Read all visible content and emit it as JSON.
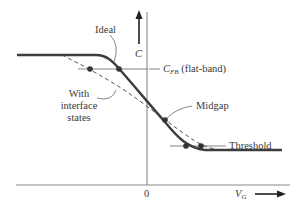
{
  "diagram": {
    "axes": {
      "y_label": "C",
      "x_label": "V",
      "x_label_sub": "G",
      "origin_label": "0"
    },
    "curves": [
      {
        "name": "Ideal",
        "style": "solid-thick"
      },
      {
        "name": "With interface states",
        "style": "dashed"
      }
    ],
    "labels": {
      "ideal": "Ideal",
      "with_line1": "With",
      "with_line2": "interface",
      "with_line3": "states",
      "cfb_main": "C",
      "cfb_sub": "FB",
      "cfb_suffix": " (flat-band)",
      "midgap": "Midgap",
      "threshold": "Threshold"
    },
    "markers": [
      {
        "level": "C_FB (flat-band)",
        "points": 2
      },
      {
        "level": "Midgap",
        "points": 1
      },
      {
        "level": "Threshold",
        "points": 2
      }
    ],
    "colors": {
      "curve": "#3d3d3d",
      "dashed": "#555555",
      "axis": "#777777",
      "text": "#3a3a3a",
      "marker": "#3a3a3a"
    }
  }
}
